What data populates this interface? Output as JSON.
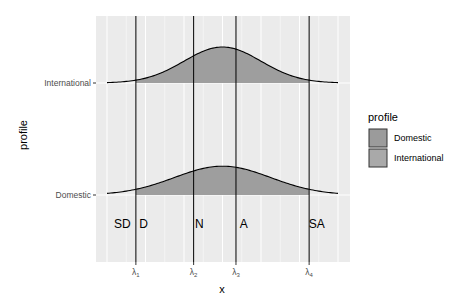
{
  "chart_data": {
    "type": "area",
    "title": "",
    "xlabel": "x",
    "ylabel": "profile",
    "categories": [
      "Domestic",
      "International"
    ],
    "x_range": [
      -3.0,
      3.0
    ],
    "thresholds": [
      {
        "name": "lambda1",
        "label": "λ",
        "sub": "1",
        "x": -2.25
      },
      {
        "name": "lambda2",
        "label": "λ",
        "sub": "2",
        "x": -0.75
      },
      {
        "name": "lambda3",
        "label": "λ",
        "sub": "3",
        "x": 0.35
      },
      {
        "name": "lambda4",
        "label": "λ",
        "sub": "4",
        "x": 2.25
      }
    ],
    "category_annotations": [
      {
        "text": "SD",
        "x": -2.6
      },
      {
        "text": "D",
        "x": -2.05
      },
      {
        "text": "N",
        "x": -0.6
      },
      {
        "text": "A",
        "x": 0.55
      },
      {
        "text": "SA",
        "x": 2.45
      }
    ],
    "series": [
      {
        "name": "Domestic",
        "mean": 0.0,
        "sd": 1.25,
        "relative_height": 0.8,
        "fill_from": -2.25,
        "fill_to": 2.25
      },
      {
        "name": "International",
        "mean": 0.0,
        "sd": 1.0,
        "relative_height": 1.0,
        "fill_from": -2.25,
        "fill_to": 2.25
      }
    ],
    "legend": {
      "title": "profile",
      "position": "right",
      "entries": [
        {
          "label": "Domestic",
          "color": "#9b9b9b"
        },
        {
          "label": "International",
          "color": "#a9a9a9"
        }
      ]
    },
    "grid": true,
    "colors": {
      "panel_bg": "#ebebeb",
      "grid": "#ffffff",
      "fill": "#9e9e9e",
      "line": "#000000"
    }
  }
}
